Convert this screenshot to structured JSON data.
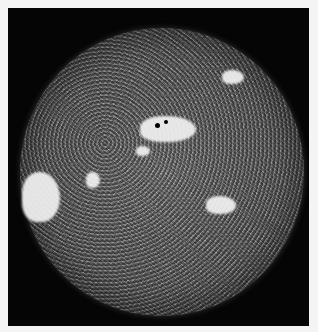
{
  "image": {
    "subject": "full-disk image of the Sun in chromospheric light",
    "background_color": "#f4f4f4",
    "frame_color": "#050505",
    "features": [
      {
        "name": "plage-upper-right",
        "x": 222,
        "y": 70,
        "w": 22,
        "h": 14
      },
      {
        "name": "plage-center",
        "x": 140,
        "y": 116,
        "w": 56,
        "h": 26
      },
      {
        "name": "plage-center-lower",
        "x": 136,
        "y": 146,
        "w": 14,
        "h": 10
      },
      {
        "name": "plage-left",
        "x": 22,
        "y": 172,
        "w": 38,
        "h": 50
      },
      {
        "name": "plage-left-mid",
        "x": 86,
        "y": 172,
        "w": 14,
        "h": 16
      },
      {
        "name": "plage-lower-right",
        "x": 206,
        "y": 196,
        "w": 30,
        "h": 18
      }
    ],
    "sunspots": [
      {
        "name": "sunspot-center",
        "x": 157,
        "y": 125
      },
      {
        "name": "sunspot-center-2",
        "x": 165,
        "y": 122
      }
    ]
  }
}
